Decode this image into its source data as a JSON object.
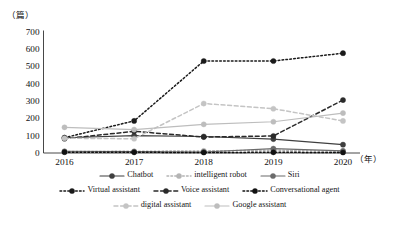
{
  "chart_data": {
    "type": "line",
    "title": "",
    "subtitle": "",
    "xlabel": "（年）",
    "ylabel": "（篇）",
    "x": [
      "2016",
      "2017",
      "2018",
      "2019",
      "2020"
    ],
    "categories": [
      "2016",
      "2017",
      "2018",
      "2019",
      "2020"
    ],
    "xlim": [
      2016,
      2020
    ],
    "ylim": [
      0,
      700
    ],
    "yticks": [
      0,
      100,
      200,
      300,
      400,
      500,
      600,
      700
    ],
    "grid": false,
    "legend_position": "bottom",
    "series": [
      {
        "name": "Chatbot",
        "color": "#3f3f3f",
        "style": "solid",
        "marker": "circle",
        "values": [
          88,
          100,
          95,
          80,
          48
        ]
      },
      {
        "name": "intelligent robot",
        "color": "#b4b4b4",
        "style": "dotted",
        "marker": "circle",
        "values": [
          8,
          10,
          12,
          16,
          10
        ]
      },
      {
        "name": "Siri",
        "color": "#6b6b6b",
        "style": "solid",
        "marker": "circle",
        "values": [
          10,
          8,
          6,
          25,
          12
        ]
      },
      {
        "name": "Virtual assistant",
        "color": "#1a1a1a",
        "style": "dotted",
        "marker": "circle",
        "values": [
          88,
          185,
          530,
          530,
          575
        ]
      },
      {
        "name": "Voice assistant",
        "color": "#2a2a2a",
        "style": "dashed",
        "marker": "circle",
        "values": [
          82,
          125,
          92,
          98,
          305
        ]
      },
      {
        "name": "Conversational agent",
        "color": "#111111",
        "style": "dotted",
        "marker": "circle",
        "values": [
          5,
          4,
          3,
          4,
          3
        ]
      },
      {
        "name": "digital assistant",
        "color": "#c4c4c4",
        "style": "dashed",
        "marker": "circle",
        "values": [
          85,
          82,
          285,
          255,
          185
        ]
      },
      {
        "name": "Google assistant",
        "color": "#bdbdbd",
        "style": "solid",
        "marker": "circle",
        "values": [
          148,
          135,
          165,
          180,
          230
        ]
      }
    ]
  },
  "axis": {
    "y_unit": "（篇）",
    "x_unit": "（年）",
    "ytick_labels": [
      "700",
      "600",
      "500",
      "400",
      "300",
      "200",
      "100",
      "0"
    ],
    "xtick_labels": [
      "2016",
      "2017",
      "2018",
      "2019",
      "2020"
    ]
  },
  "legend": {
    "rows": [
      [
        "Chatbot",
        "intelligent robot",
        "Siri"
      ],
      [
        "Virtual assistant",
        "Voice assistant",
        "Conversational agent"
      ],
      [
        "digital assistant",
        "Google assistant"
      ]
    ],
    "items": [
      {
        "label": "Chatbot",
        "series_index": 0
      },
      {
        "label": "intelligent robot",
        "series_index": 1
      },
      {
        "label": "Siri",
        "series_index": 2
      },
      {
        "label": "Virtual assistant",
        "series_index": 3
      },
      {
        "label": "Voice assistant",
        "series_index": 4
      },
      {
        "label": "Conversational agent",
        "series_index": 5
      },
      {
        "label": "digital assistant",
        "series_index": 6
      },
      {
        "label": "Google assistant",
        "series_index": 7
      }
    ]
  }
}
